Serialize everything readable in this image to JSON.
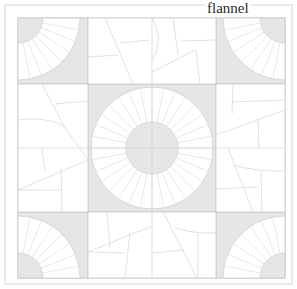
{
  "label": "flannel",
  "colors": {
    "line": "#c8c8c8",
    "shade": "#e6e6e6",
    "background": "#ffffff",
    "border": "#d4d4d4"
  },
  "layout": {
    "outer_border": [
      5,
      5,
      292,
      284
    ],
    "inner_border": [
      18,
      18,
      285,
      278
    ],
    "grid_x": [
      18,
      88,
      216,
      285
    ],
    "grid_y": [
      18,
      84,
      212,
      278
    ]
  },
  "blocks": {
    "corners": [
      {
        "position": "top-left",
        "pattern": "quarter-fan",
        "wedges": 8
      },
      {
        "position": "top-right",
        "pattern": "quarter-fan",
        "wedges": 8
      },
      {
        "position": "bottom-left",
        "pattern": "quarter-fan",
        "wedges": 8
      },
      {
        "position": "bottom-right",
        "pattern": "quarter-fan",
        "wedges": 8
      }
    ],
    "center": {
      "pattern": "full-ring-fan",
      "wedges": 32
    },
    "edges": [
      {
        "position": "top",
        "pattern": "crazy-patch"
      },
      {
        "position": "left",
        "pattern": "crazy-patch"
      },
      {
        "position": "right",
        "pattern": "crazy-patch"
      },
      {
        "position": "bottom",
        "pattern": "crazy-patch"
      }
    ]
  }
}
